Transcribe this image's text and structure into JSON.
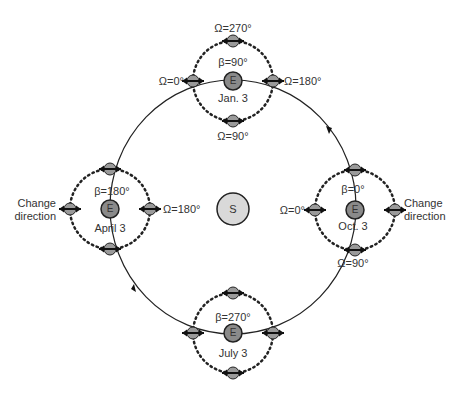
{
  "diagram": {
    "sun_label": "S",
    "earth_label": "E",
    "colors": {
      "orbit": "#222222",
      "sun_fill": "#d9d9d9",
      "earth_fill": "#8a8a8a",
      "satellite_fill": "#9a9a9a",
      "stroke": "#222222"
    },
    "positions": {
      "jan": {
        "date": "Jan. 3",
        "beta": "β=90°",
        "omega_top": "Ω=270°",
        "omega_left": "Ω=0°",
        "omega_right": "Ω=180°",
        "omega_bottom": "Ω=90°"
      },
      "april": {
        "date": "April 3",
        "beta": "β=180°",
        "omega_right": "Ω=180°",
        "note_left": [
          "Change",
          "direction"
        ]
      },
      "july": {
        "date": "July 3",
        "beta": "β=270°"
      },
      "oct": {
        "date": "Oct. 3",
        "beta": "β=0°",
        "omega_left": "Ω=0°",
        "omega_bottom": "Ω=90°",
        "note_right": [
          "Change",
          "direction"
        ]
      }
    }
  }
}
